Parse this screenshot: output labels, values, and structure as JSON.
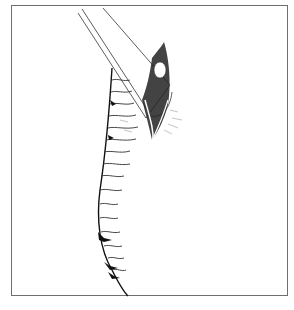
{
  "figure": {
    "type": "line-drawing illustration",
    "colors": {
      "background": "#ffffff",
      "border": "#6e6e6e",
      "ink": "#111111"
    }
  }
}
